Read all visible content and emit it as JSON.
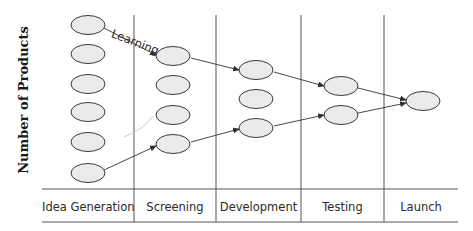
{
  "diagram": {
    "y_axis_label": "Number of Products",
    "annotation": "Learning",
    "stages": [
      {
        "label": "Idea Generation",
        "x": 42,
        "w": 92
      },
      {
        "label": "Screening",
        "x": 134,
        "w": 82
      },
      {
        "label": "Development",
        "x": 216,
        "w": 85
      },
      {
        "label": "Testing",
        "x": 301,
        "w": 83
      },
      {
        "label": "Launch",
        "x": 384,
        "w": 74
      }
    ],
    "colors": {
      "ellipse_fill": "#ebebeb",
      "stroke": "#3a3a3a",
      "grid": "#555555"
    },
    "nodes": {
      "idea_generation": 6,
      "screening": 4,
      "development": 3,
      "testing": 2,
      "launch": 1
    }
  }
}
